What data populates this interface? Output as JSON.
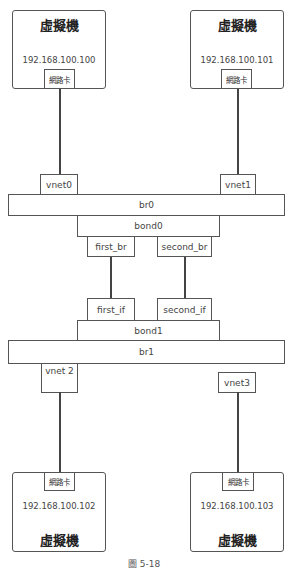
{
  "diagram": {
    "vms": [
      {
        "title": "虛擬機",
        "ip": "192.168.100.100",
        "nic": "網路卡"
      },
      {
        "title": "虛擬機",
        "ip": "192.168.100.101",
        "nic": "網路卡"
      },
      {
        "title": "虛擬機",
        "ip": "192.168.100.102",
        "nic": "網路卡"
      },
      {
        "title": "虛擬機",
        "ip": "192.168.100.103",
        "nic": "網路卡"
      }
    ],
    "vnets": [
      "vnet0",
      "vnet1",
      "vnet 2",
      "vnet3"
    ],
    "bridges": [
      "br0",
      "br1"
    ],
    "bonds": [
      "bond0",
      "bond1"
    ],
    "bond0_members": [
      "first_br",
      "second_br"
    ],
    "bond1_members": [
      "first_if",
      "second_if"
    ],
    "caption": "圖 5-18"
  }
}
